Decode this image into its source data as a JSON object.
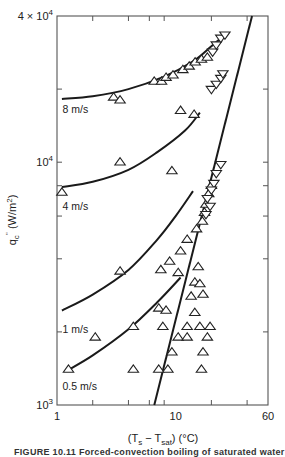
{
  "chart_data": {
    "type": "scatter",
    "title": "",
    "xlabel": "(T_s − T_sat) (°C)",
    "ylabel": "q_c'' (W/m²)",
    "xscale": "log",
    "yscale": "log",
    "xlim": [
      1,
      60
    ],
    "ylim": [
      1000,
      40000
    ],
    "x_tick_labels": [
      {
        "value": 1,
        "label": "1"
      },
      {
        "value": 10,
        "label": "10"
      },
      {
        "value": 60,
        "label": "60"
      }
    ],
    "x_minor_ticks": [
      2,
      4,
      6,
      8,
      20,
      40
    ],
    "y_tick_labels": [
      {
        "value": 1000,
        "label": "10",
        "sup": "3"
      },
      {
        "value": 10000,
        "label": "10",
        "sup": "4"
      },
      {
        "value": 40000,
        "label": "4 × 10",
        "sup": "4"
      }
    ],
    "y_minor_ticks": [
      2000,
      4000,
      6000,
      8000,
      20000
    ],
    "grid": false,
    "legend": "none",
    "series": [
      {
        "name": "8 m/s",
        "kind": "curve",
        "label_pos": [
          1.05,
          16500
        ],
        "points": [
          [
            1.1,
            18200
          ],
          [
            2,
            18700
          ],
          [
            4,
            20000
          ],
          [
            8,
            22500
          ],
          [
            14,
            26000
          ],
          [
            20,
            30000
          ],
          [
            27,
            34000
          ]
        ]
      },
      {
        "name": "4 m/s",
        "kind": "curve",
        "label_pos": [
          1.05,
          6600
        ],
        "points": [
          [
            1.1,
            7900
          ],
          [
            2,
            8300
          ],
          [
            4,
            9300
          ],
          [
            7,
            11000
          ],
          [
            12,
            13500
          ],
          [
            16,
            16000
          ]
        ]
      },
      {
        "name": "1 m/s",
        "kind": "curve",
        "label_pos": [
          1.05,
          2050
        ],
        "points": [
          [
            1.1,
            2450
          ],
          [
            2,
            2850
          ],
          [
            4,
            3600
          ],
          [
            7,
            4800
          ],
          [
            10,
            6000
          ],
          [
            14,
            7600
          ]
        ]
      },
      {
        "name": "0.5 m/s",
        "kind": "curve",
        "label_pos": [
          1.05,
          1200
        ],
        "points": [
          [
            1.2,
            1380
          ],
          [
            2,
            1600
          ],
          [
            4,
            2050
          ],
          [
            7,
            2650
          ],
          [
            11,
            3350
          ]
        ]
      },
      {
        "name": "fully developed boiling",
        "kind": "line",
        "points": [
          [
            6.6,
            1000
          ],
          [
            44,
            40000
          ]
        ]
      },
      {
        "name": "data (up-triangles)",
        "kind": "markers",
        "marker": "triangle-up",
        "points": [
          [
            3.0,
            18500
          ],
          [
            3.4,
            18000
          ],
          [
            6.6,
            21500
          ],
          [
            7.6,
            21500
          ],
          [
            8.3,
            22300
          ],
          [
            9.5,
            22800
          ],
          [
            11.5,
            24000
          ],
          [
            13,
            24800
          ],
          [
            14.6,
            25800
          ],
          [
            16.5,
            26500
          ],
          [
            18.5,
            27000
          ],
          [
            11,
            16300
          ],
          [
            14.3,
            15700
          ],
          [
            3.4,
            10000
          ],
          [
            9.3,
            9200
          ],
          [
            1.1,
            7500
          ],
          [
            20,
            8000
          ],
          [
            19,
            7400
          ],
          [
            18,
            6700
          ],
          [
            17.5,
            6200
          ],
          [
            16.8,
            5700
          ],
          [
            15,
            5300
          ],
          [
            12.5,
            4800
          ],
          [
            11,
            4300
          ],
          [
            8.9,
            3900
          ],
          [
            10.5,
            3500
          ],
          [
            3.4,
            3550
          ],
          [
            7.5,
            3600
          ],
          [
            14.5,
            3200
          ],
          [
            15.5,
            3700
          ],
          [
            17,
            2850
          ],
          [
            16,
            3150
          ],
          [
            13.5,
            2800
          ],
          [
            7.2,
            2500
          ],
          [
            8.3,
            2450
          ],
          [
            14.5,
            2400
          ],
          [
            4.4,
            2100
          ],
          [
            12.5,
            2100
          ],
          [
            16,
            2100
          ],
          [
            7.8,
            2100
          ],
          [
            19.5,
            2100
          ],
          [
            2.1,
            1900
          ],
          [
            10.5,
            1900
          ],
          [
            12.5,
            1900
          ],
          [
            18.5,
            1900
          ],
          [
            9.3,
            1650
          ],
          [
            17,
            1650
          ],
          [
            1.25,
            1400
          ],
          [
            4.4,
            1400
          ],
          [
            7.2,
            1400
          ],
          [
            8.6,
            1400
          ],
          [
            16.5,
            1400
          ]
        ]
      },
      {
        "name": "data (down-triangles)",
        "kind": "markers",
        "marker": "triangle-down",
        "points": [
          [
            20.5,
            28500
          ],
          [
            22,
            30500
          ],
          [
            24,
            32500
          ],
          [
            26,
            33500
          ],
          [
            20,
            20000
          ],
          [
            22,
            21000
          ],
          [
            24,
            22200
          ],
          [
            25,
            23200
          ],
          [
            24,
            9800
          ],
          [
            22,
            9000
          ],
          [
            21,
            8200
          ],
          [
            20,
            7700
          ],
          [
            18.5,
            7100
          ],
          [
            19.5,
            6600
          ],
          [
            18,
            6100
          ]
        ]
      }
    ]
  },
  "figure": {
    "caption": "FIGURE 10.11   Forced-convection boiling of saturated water"
  }
}
